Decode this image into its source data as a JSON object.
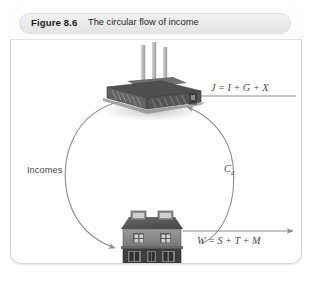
{
  "figure": {
    "number": "Figure 8.6",
    "caption": "The circular flow of income",
    "frame_border_color": "#d8d8d8",
    "header_pill_color": "#eaeaea"
  },
  "diagram": {
    "type": "circular-flow-of-income",
    "nodes": [
      {
        "id": "firms",
        "icon": "factory-icon",
        "description": "Factory building with three smokestacks",
        "position": "top-center"
      },
      {
        "id": "households",
        "icon": "house-icon",
        "description": "Two-storey house with mansard roof and dormer windows",
        "position": "bottom-center"
      }
    ],
    "flows": [
      {
        "id": "incomes",
        "label": "Incomes",
        "from": "firms",
        "to": "households",
        "shape": "arc-left",
        "direction": "counter-clockwise"
      },
      {
        "id": "consumption",
        "label": "C",
        "label_subscript": "d",
        "from": "households",
        "to": "firms",
        "shape": "arc-right",
        "direction": "counter-clockwise"
      },
      {
        "id": "injections",
        "label": "J = I + G + X",
        "to": "firms",
        "shape": "straight-horizontal",
        "direction": "leftward"
      },
      {
        "id": "withdrawals",
        "label": "W = S + T + M",
        "from": "households",
        "shape": "straight-horizontal",
        "direction": "rightward"
      }
    ],
    "line_color": "#8e8e8e",
    "label_color": "#4a4a4a"
  }
}
